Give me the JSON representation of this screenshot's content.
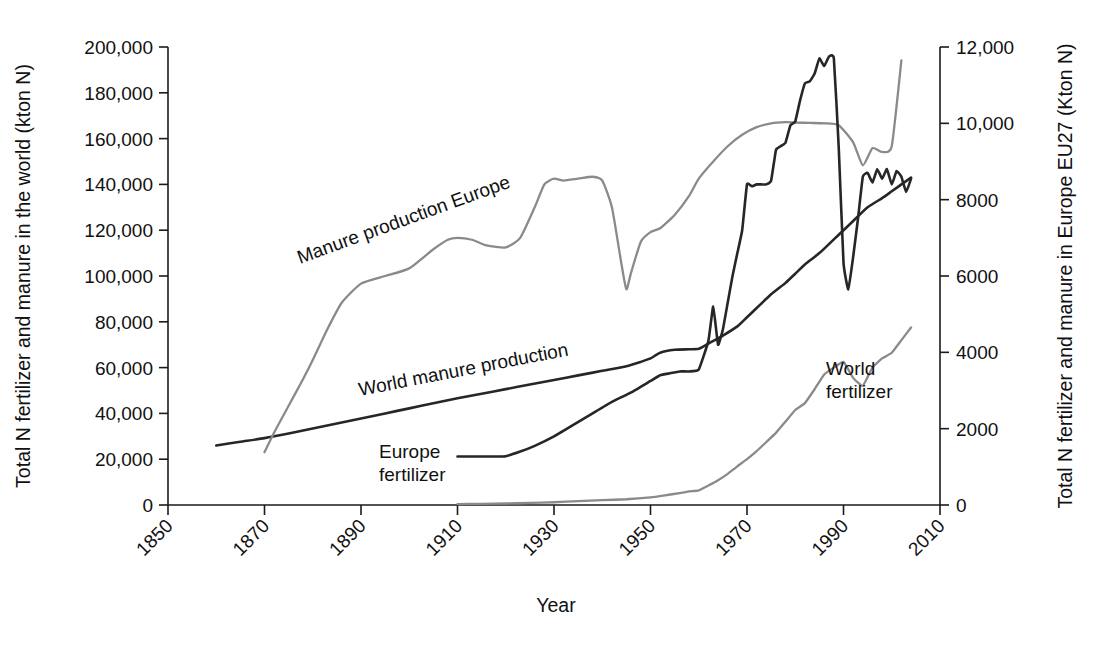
{
  "chart_data": {
    "type": "line",
    "title": "",
    "xlabel": "Year",
    "ylabel": "Total N fertilizer and manure in the world (kton N)",
    "y2label": "Total N fertilizer and manure in Europe EU27 (Kton N)",
    "grid": false,
    "legend_position": "inline-annotations",
    "xlim": [
      1850,
      2010
    ],
    "ylim": [
      0,
      200000
    ],
    "y2lim": [
      0,
      12000
    ],
    "xticks": [
      "1850",
      "1870",
      "1890",
      "1910",
      "1930",
      "1950",
      "1970",
      "1990",
      "2010"
    ],
    "xtick_values": [
      1850,
      1870,
      1890,
      1910,
      1930,
      1950,
      1970,
      1990,
      2010
    ],
    "yticks": [
      "0",
      "20,000",
      "40,000",
      "60,000",
      "80,000",
      "100,000",
      "120,000",
      "140,000",
      "160,000",
      "180,000",
      "200,000"
    ],
    "ytick_values": [
      0,
      20000,
      40000,
      60000,
      80000,
      100000,
      120000,
      140000,
      160000,
      180000,
      200000
    ],
    "y2ticks": [
      "0",
      "2000",
      "4000",
      "6000",
      "8000",
      "10,000",
      "12,000"
    ],
    "y2tick_values": [
      0,
      2000,
      4000,
      6000,
      8000,
      10000,
      12000
    ],
    "colors": {
      "dark": "#262626",
      "gray": "#8a8a8a"
    },
    "series": [
      {
        "name": "World manure production",
        "axis": "left",
        "color": "#262626",
        "label_text": "World manure production",
        "label_rotation": -11,
        "x": [
          1860,
          1865,
          1870,
          1875,
          1880,
          1885,
          1890,
          1895,
          1900,
          1905,
          1910,
          1915,
          1920,
          1925,
          1930,
          1935,
          1940,
          1945,
          1948,
          1950,
          1952,
          1955,
          1958,
          1960,
          1962,
          1965,
          1968,
          1970,
          1972,
          1975,
          1978,
          1980,
          1982,
          1985,
          1988,
          1990,
          1992,
          1995,
          1998,
          2000,
          2002,
          2004
        ],
        "y": [
          26000,
          27600,
          29200,
          31200,
          33400,
          35600,
          37800,
          40000,
          42200,
          44400,
          46600,
          48600,
          50600,
          52600,
          54600,
          56600,
          58600,
          60600,
          62500,
          64000,
          66500,
          67800,
          68000,
          68200,
          70500,
          74000,
          78000,
          82000,
          86000,
          92000,
          97000,
          101000,
          105000,
          110000,
          116000,
          120000,
          124000,
          130000,
          134000,
          137000,
          140000,
          143000
        ]
      },
      {
        "name": "Manure production Europe",
        "axis": "right",
        "color": "#8a8a8a",
        "label_text": "Manure production Europe",
        "label_rotation": -20,
        "x": [
          1870,
          1872,
          1875,
          1878,
          1880,
          1883,
          1886,
          1890,
          1895,
          1900,
          1905,
          1908,
          1910,
          1913,
          1916,
          1920,
          1923,
          1926,
          1928,
          1930,
          1932,
          1935,
          1938,
          1940,
          1942,
          1944,
          1945,
          1946,
          1948,
          1950,
          1952,
          1955,
          1958,
          1960,
          1963,
          1966,
          1969,
          1972,
          1975,
          1978,
          1980,
          1983,
          1986,
          1989,
          1992,
          1994,
          1996,
          1998,
          2000,
          2002
        ],
        "y": [
          1380,
          1900,
          2600,
          3300,
          3800,
          4600,
          5300,
          5800,
          6000,
          6200,
          6700,
          6950,
          7000,
          6950,
          6800,
          6750,
          7000,
          7800,
          8400,
          8550,
          8500,
          8550,
          8600,
          8500,
          7800,
          6300,
          5650,
          6100,
          6900,
          7150,
          7250,
          7600,
          8100,
          8550,
          9000,
          9400,
          9700,
          9900,
          10000,
          10030,
          10020,
          10010,
          10000,
          9950,
          9500,
          8900,
          9350,
          9250,
          9400,
          11650
        ]
      },
      {
        "name": "Europe fertilizer",
        "axis": "right",
        "color": "#262626",
        "label_text": "Europe fertilizer",
        "label_rotation": 0,
        "x": [
          1910,
          1913,
          1916,
          1918,
          1920,
          1923,
          1926,
          1930,
          1934,
          1938,
          1942,
          1946,
          1950,
          1952,
          1954,
          1956,
          1958,
          1960,
          1962,
          1963,
          1964,
          1965,
          1966,
          1967,
          1968,
          1969,
          1970,
          1971,
          1972,
          1973,
          1974,
          1975,
          1976,
          1977,
          1978,
          1979,
          1980,
          1981,
          1982,
          1983,
          1984,
          1985,
          1986,
          1987,
          1988,
          1989,
          1990,
          1991,
          1992,
          1993,
          1994,
          1995,
          1996,
          1997,
          1998,
          1999,
          2000,
          2001,
          2002,
          2003,
          2004
        ],
        "y": [
          1270,
          1270,
          1270,
          1270,
          1280,
          1400,
          1550,
          1800,
          2100,
          2400,
          2700,
          2950,
          3250,
          3400,
          3450,
          3500,
          3500,
          3550,
          4300,
          5200,
          4200,
          4600,
          5300,
          6000,
          6600,
          7200,
          8400,
          8350,
          8400,
          8400,
          8400,
          8500,
          9300,
          9400,
          9500,
          9950,
          10050,
          10600,
          11050,
          11100,
          11300,
          11700,
          11500,
          11750,
          11700,
          9400,
          6350,
          5650,
          6500,
          7500,
          8600,
          8700,
          8450,
          8800,
          8550,
          8800,
          8400,
          8750,
          8600,
          8200,
          8550
        ]
      },
      {
        "name": "World fertilizer",
        "axis": "left",
        "color": "#8a8a8a",
        "label_text": "World fertilizer",
        "label_rotation": 0,
        "x": [
          1910,
          1915,
          1920,
          1925,
          1930,
          1935,
          1940,
          1945,
          1950,
          1953,
          1956,
          1958,
          1960,
          1962,
          1964,
          1966,
          1968,
          1970,
          1972,
          1974,
          1976,
          1978,
          1980,
          1982,
          1984,
          1986,
          1988,
          1990,
          1992,
          1994,
          1996,
          1998,
          2000,
          2002,
          2004
        ],
        "y": [
          400,
          500,
          650,
          900,
          1200,
          1700,
          2100,
          2500,
          3300,
          4200,
          5200,
          5900,
          6400,
          8500,
          10800,
          13600,
          16900,
          20000,
          23500,
          27500,
          31500,
          36500,
          41500,
          44500,
          50500,
          57000,
          60000,
          62500,
          55500,
          52000,
          60000,
          64000,
          66500,
          72000,
          77500
        ]
      }
    ],
    "annotations": [
      {
        "text": "Manure production Europe",
        "x_px": 300,
        "y_px": 264,
        "rotation": -20,
        "color": "#6f6f6f"
      },
      {
        "text": "World manure production",
        "x_px": 360,
        "y_px": 396,
        "rotation": -11,
        "color": "#1f1f1f"
      },
      {
        "text": "Europe",
        "x_px": 379,
        "y_px": 458,
        "rotation": 0,
        "color": "#1f1f1f"
      },
      {
        "text": "fertilizer",
        "x_px": 379,
        "y_px": 481,
        "rotation": 0,
        "color": "#1f1f1f"
      },
      {
        "text": "World",
        "x_px": 826,
        "y_px": 375,
        "rotation": 0,
        "color": "#1f1f1f"
      },
      {
        "text": "fertilizer",
        "x_px": 826,
        "y_px": 398,
        "rotation": 0,
        "color": "#1f1f1f"
      }
    ]
  }
}
